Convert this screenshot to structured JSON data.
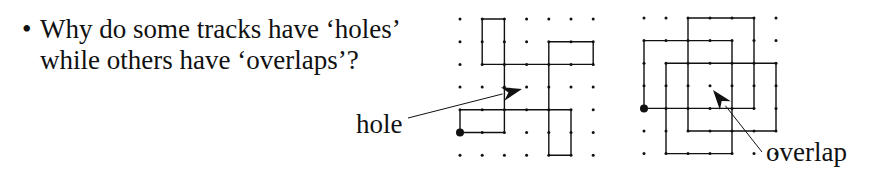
{
  "bullet": {
    "symbol": "•",
    "line1": "Why do some tracks have ‘holes’",
    "line2": "while others have ‘overlaps’?"
  },
  "labels": {
    "hole": "hole",
    "overlap": "overlap"
  },
  "diagrams": [
    {
      "name": "hole-track",
      "grid": {
        "cols": 7,
        "rows": 7,
        "origin": [
          460,
          19
        ],
        "spacing": [
          22.2,
          22.7
        ]
      },
      "start": [
        0,
        5
      ],
      "path": [
        [
          0,
          5
        ],
        [
          2,
          5
        ],
        [
          2,
          2
        ],
        [
          1,
          2
        ],
        [
          1,
          0
        ],
        [
          2,
          0
        ],
        [
          2,
          2
        ],
        [
          4,
          2
        ],
        [
          6,
          2
        ],
        [
          6,
          1
        ],
        [
          4,
          1
        ],
        [
          4,
          6
        ],
        [
          5,
          6
        ],
        [
          5,
          4
        ],
        [
          0,
          4
        ],
        [
          0,
          5
        ]
      ],
      "arrow": {
        "from": [
          408,
          118
        ],
        "to": [
          522,
          89
        ]
      }
    },
    {
      "name": "overlap-track",
      "grid": {
        "cols": 7,
        "rows": 7,
        "origin": [
          644,
          18
        ],
        "spacing": [
          22,
          22.6
        ]
      },
      "start": [
        0,
        4
      ],
      "path": [
        [
          0,
          4
        ],
        [
          0,
          1
        ],
        [
          4,
          1
        ],
        [
          4,
          6
        ],
        [
          1,
          6
        ],
        [
          1,
          2
        ],
        [
          6,
          2
        ],
        [
          6,
          5
        ],
        [
          2,
          5
        ],
        [
          2,
          0
        ],
        [
          5,
          0
        ],
        [
          5,
          4
        ],
        [
          0,
          4
        ]
      ],
      "arrow": {
        "from": [
          762,
          152
        ],
        "to": [
          713,
          90
        ]
      }
    }
  ],
  "colors": {
    "ink": "#111111",
    "background": "#ffffff"
  }
}
